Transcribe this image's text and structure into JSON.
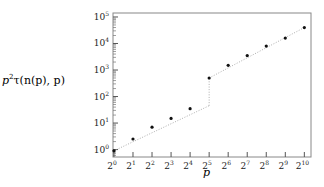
{
  "chart_data": {
    "type": "scatter",
    "title": "",
    "xlabel": "p",
    "ylabel": "p²τ(n(p), p)",
    "x_scale": "log2",
    "y_scale": "log10",
    "x_tick_exponents": [
      0,
      1,
      2,
      3,
      4,
      5,
      6,
      7,
      8,
      9,
      10
    ],
    "x_tick_labels": [
      "2^0",
      "2^1",
      "2^2",
      "2^3",
      "2^4",
      "2^5",
      "2^6",
      "2^7",
      "2^8",
      "2^9",
      "2^10"
    ],
    "y_tick_exponents": [
      0,
      1,
      2,
      3,
      4,
      5
    ],
    "y_tick_labels": [
      "10^0",
      "10^1",
      "10^2",
      "10^3",
      "10^4",
      "10^5"
    ],
    "xlim_exp": [
      -0.05,
      10.35
    ],
    "ylim_exp": [
      -0.28,
      5.15
    ],
    "grid": false,
    "legend": null,
    "series": [
      {
        "name": "data points",
        "style": "markers",
        "x": [
          1,
          2,
          4,
          8,
          16,
          32,
          64,
          128,
          256,
          512,
          1024
        ],
        "y": [
          0.9,
          2.5,
          7,
          15,
          35,
          500,
          1500,
          3500,
          8000,
          16000,
          40000
        ]
      },
      {
        "name": "reference curve",
        "style": "dotted",
        "segments": [
          {
            "x": [
              1,
              32
            ],
            "y": [
              0.9,
              45
            ]
          },
          {
            "x": [
              32,
              32
            ],
            "y": [
              45,
              500
            ]
          },
          {
            "x": [
              32,
              1024
            ],
            "y": [
              500,
              40000
            ]
          }
        ]
      }
    ]
  },
  "labels": {
    "y_axis_base": "p",
    "y_axis_sup": "2",
    "y_axis_rest": "τ(n(p), p)",
    "x_axis": "p"
  }
}
